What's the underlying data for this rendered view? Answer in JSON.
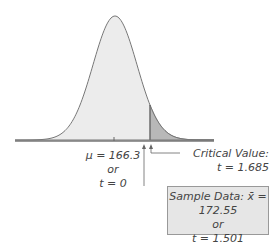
{
  "diagram": {
    "type": "t-distribution right-tailed test",
    "mean_label": "μ = 166.3",
    "mean_or": "or",
    "mean_t": "t = 0",
    "critical_label": "Critical Value:",
    "critical_t": "t = 1.685",
    "sample_label": "Sample Data: x̄ = 172.55",
    "sample_or": "or",
    "sample_t": "t = 1.501",
    "colors": {
      "curve_fill": "#ececec",
      "tail_fill": "#b8b8b8",
      "stroke": "#777777",
      "box_fill": "#e6e6e6"
    }
  }
}
